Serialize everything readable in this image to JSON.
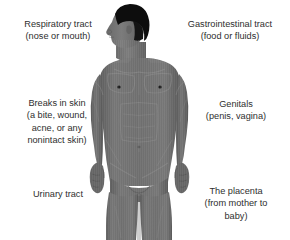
{
  "diagram": {
    "background_color": "#ffffff",
    "text_color": "#2e2e2e",
    "body_color": "#6f6f6f",
    "body_shadow_color": "#565656",
    "hair_color": "#0d0d0d"
  },
  "labels": {
    "respiratory": {
      "line1": "Respiratory tract",
      "line2": "(nose or mouth)"
    },
    "gastrointestinal": {
      "line1": "Gastrointestinal tract",
      "line2": "(food or fluids)"
    },
    "breaks_in_skin": {
      "line1": "Breaks in skin",
      "line2": "(a bite, wound,",
      "line3": "acne, or any",
      "line4": "nonintact skin)"
    },
    "genitals": {
      "line1": "Genitals",
      "line2": "(penis, vagina)"
    },
    "urinary": {
      "line1": "Urinary tract"
    },
    "placenta": {
      "line1": "The placenta",
      "line2": "(from mother to",
      "line3": "baby)"
    }
  }
}
